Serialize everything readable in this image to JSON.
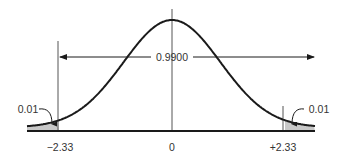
{
  "chart_data": {
    "type": "area",
    "title": "",
    "subtitle": "",
    "xlabel": "",
    "ylabel": "",
    "distribution": "normal",
    "mean": 0,
    "sd": 1,
    "xlim": [
      -4,
      4
    ],
    "grid": false,
    "legend": null,
    "tick_labels": [
      "−2.33",
      "0",
      "+2.33"
    ],
    "ticks": [
      -2.33,
      0,
      2.33
    ],
    "critical_values": {
      "lower": -2.33,
      "upper": 2.33
    },
    "regions": [
      {
        "name": "left-tail",
        "from": -4,
        "to": -2.33,
        "area": 0.01,
        "shaded": true,
        "label": "0.01"
      },
      {
        "name": "center",
        "from": -2.33,
        "to": 2.33,
        "area": 0.99,
        "shaded": false,
        "label": "0.9900"
      },
      {
        "name": "right-tail",
        "from": 2.33,
        "to": 4,
        "area": 0.01,
        "shaded": true,
        "label": "0.01"
      }
    ],
    "colors": {
      "curve": "#1a1a1a",
      "axis": "#1a1a1a",
      "shade": "#c8c8c8",
      "guides": "#555555",
      "text": "#333333"
    }
  },
  "labels": {
    "center_area": "0.9900",
    "left_tail": "0.01",
    "right_tail": "0.01",
    "tick_left": "−2.33",
    "tick_center": "0",
    "tick_right": "+2.33"
  }
}
